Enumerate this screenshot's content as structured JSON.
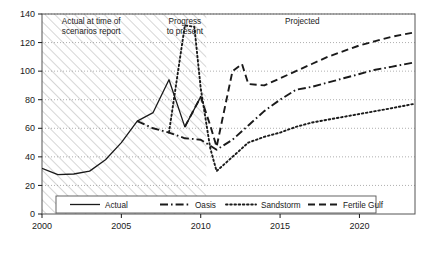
{
  "chart_data": {
    "type": "line",
    "title": "",
    "xlabel": "",
    "ylabel": "",
    "xlim": [
      2000,
      2023.5
    ],
    "ylim": [
      0,
      140
    ],
    "ytick_step": 20,
    "yticks": [
      0,
      20,
      40,
      60,
      80,
      100,
      120,
      140
    ],
    "xticks": [
      2000,
      2005,
      2010,
      2015,
      2020
    ],
    "xtick_labels": [
      "2000",
      "2005",
      "2010",
      "2015",
      "2020"
    ],
    "ytick_labels": [
      "0",
      "20",
      "40",
      "60",
      "80",
      "100",
      "120",
      "140"
    ],
    "grid": "horizontal-dotted",
    "legend_position": "bottom-inside",
    "series": [
      {
        "name": "Actual",
        "style": "solid",
        "color": "#1a1a1a",
        "points": [
          [
            2000,
            32
          ],
          [
            2001,
            27.5
          ],
          [
            2002,
            28
          ],
          [
            2003,
            30
          ],
          [
            2004,
            38
          ],
          [
            2005,
            50
          ],
          [
            2006,
            65
          ],
          [
            2007,
            71
          ],
          [
            2008,
            94
          ],
          [
            2009,
            61
          ],
          [
            2010,
            82
          ]
        ]
      },
      {
        "name": "Oasis",
        "style": "dash-dot",
        "color": "#1a1a1a",
        "points": [
          [
            2006,
            65
          ],
          [
            2007,
            60
          ],
          [
            2008,
            57
          ],
          [
            2009,
            53
          ],
          [
            2010,
            52
          ],
          [
            2011,
            45
          ],
          [
            2012,
            52
          ],
          [
            2013,
            62
          ],
          [
            2014,
            72
          ],
          [
            2015,
            80
          ],
          [
            2016,
            87
          ],
          [
            2017,
            89
          ],
          [
            2018,
            92
          ],
          [
            2019,
            95
          ],
          [
            2020,
            98
          ],
          [
            2021,
            101
          ],
          [
            2022,
            103
          ],
          [
            2023.4,
            106
          ]
        ]
      },
      {
        "name": "Sandstorm",
        "style": "dotted",
        "color": "#1a1a1a",
        "points": [
          [
            2008,
            57
          ],
          [
            2009,
            132
          ],
          [
            2009.6,
            131
          ],
          [
            2010,
            88
          ],
          [
            2010.6,
            46
          ],
          [
            2011,
            30
          ],
          [
            2012,
            40
          ],
          [
            2013,
            50
          ],
          [
            2014,
            54
          ],
          [
            2015,
            57
          ],
          [
            2016,
            61
          ],
          [
            2017,
            64
          ],
          [
            2018,
            66
          ],
          [
            2019,
            68
          ],
          [
            2020,
            70
          ],
          [
            2021,
            72
          ],
          [
            2022,
            74
          ],
          [
            2023.4,
            77
          ]
        ]
      },
      {
        "name": "Fertile Gulf",
        "style": "dashed",
        "color": "#1a1a1a",
        "points": [
          [
            2009,
            61
          ],
          [
            2010,
            82
          ],
          [
            2010.6,
            62
          ],
          [
            2011,
            47
          ],
          [
            2012,
            100
          ],
          [
            2012.6,
            105
          ],
          [
            2013,
            91
          ],
          [
            2014,
            90
          ],
          [
            2015,
            95
          ],
          [
            2016,
            100
          ],
          [
            2017,
            105
          ],
          [
            2018,
            110
          ],
          [
            2019,
            114
          ],
          [
            2020,
            118
          ],
          [
            2021,
            121
          ],
          [
            2022,
            124
          ],
          [
            2023.4,
            127
          ]
        ]
      }
    ],
    "annotations": [
      {
        "name": "actual-region-label",
        "text_line1": "Actual at time of",
        "text_line2": "scenarios report",
        "x": 2003.1,
        "y": 133
      },
      {
        "name": "progress-region-label",
        "text_line1": "Progress",
        "text_line2": "to present",
        "x": 2009.0,
        "y": 133
      },
      {
        "name": "projected-region-label",
        "text_line1": "Projected",
        "text_line2": "",
        "x": 2016.4,
        "y": 133
      }
    ],
    "shaded_region": {
      "label": "hatched-history-band",
      "x_start": 2000,
      "x_end": 2010.35
    }
  },
  "legend": {
    "entries": [
      {
        "label": "Actual",
        "style": "solid"
      },
      {
        "label": "Oasis",
        "style": "dash-dot"
      },
      {
        "label": "Sandstorm",
        "style": "dotted"
      },
      {
        "label": "Fertile Gulf",
        "style": "dashed"
      }
    ]
  }
}
